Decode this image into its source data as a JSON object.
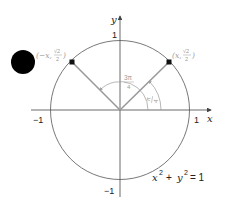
{
  "diagram": {
    "type": "unit-circle",
    "equation": {
      "base_x": "x",
      "exp_x": "2",
      "plus": "+",
      "base_y": "y",
      "exp_y": "2",
      "rhs": "= 1"
    },
    "axes": {
      "x_label": "x",
      "y_label": "y",
      "x_ticks": {
        "neg": "−1",
        "pos": "1"
      },
      "y_ticks": {
        "neg": "−1",
        "pos": "1"
      }
    },
    "points": [
      {
        "name": "point-pi-over-4",
        "label_open": "(x,",
        "label_num": "√2",
        "label_den": "2",
        "label_close": ")"
      },
      {
        "name": "point-3pi-over-4",
        "label_open": "(−x,",
        "label_num": "√2",
        "label_den": "2",
        "label_close": ")"
      }
    ],
    "angles": [
      {
        "name": "angle-pi-over-4",
        "num": "π",
        "den": "4"
      },
      {
        "name": "angle-3pi-over-4",
        "num": "3π",
        "den": "4"
      }
    ],
    "colors": {
      "axis": "#444444",
      "circle": "#555555",
      "radius": "#9a9a9a",
      "label_grey": "#9a9a9a",
      "point": "#111111",
      "blob": "#000000"
    }
  }
}
